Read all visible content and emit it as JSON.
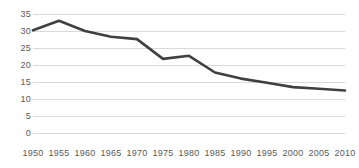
{
  "chart_data": {
    "type": "line",
    "title": "",
    "subtitle": "",
    "xlabel": "",
    "ylabel": "",
    "x": [
      1950,
      1955,
      1960,
      1965,
      1970,
      1975,
      1980,
      1985,
      1990,
      1995,
      2000,
      2005,
      2010
    ],
    "categories": [
      "1950",
      "1955",
      "1960",
      "1965",
      "1970",
      "1975",
      "1980",
      "1985",
      "1990",
      "1995",
      "2000",
      "2005",
      "2010"
    ],
    "values": [
      30.2,
      33.0,
      30.0,
      28.3,
      27.6,
      21.8,
      22.7,
      17.8,
      16.0,
      14.8,
      13.5,
      13.0,
      12.5
    ],
    "series": [
      {
        "name": "series-1",
        "values": [
          30.2,
          33.0,
          30.0,
          28.3,
          27.6,
          21.8,
          22.7,
          17.8,
          16.0,
          14.8,
          13.5,
          13.0,
          12.5
        ]
      }
    ],
    "ylim": [
      0,
      35
    ],
    "xlim": [
      1950,
      2010
    ],
    "yticks": [
      0,
      5,
      10,
      15,
      20,
      25,
      30,
      35
    ],
    "ytick_labels": [
      "0",
      "5",
      "10",
      "15",
      "20",
      "25",
      "30",
      "35"
    ],
    "xtick_labels": [
      "1950",
      "1955",
      "1960",
      "1965",
      "1970",
      "1975",
      "1980",
      "1985",
      "1990",
      "1995",
      "2000",
      "2005",
      "2010"
    ],
    "grid": true,
    "grid_axis": "y",
    "legend": false,
    "legend_position": "none",
    "annotations": [],
    "colors": {
      "line": "#404040",
      "gridline": "#d9d9d9",
      "tick_text": "#595959",
      "background": "#ffffff"
    },
    "line_width": 2.6
  }
}
